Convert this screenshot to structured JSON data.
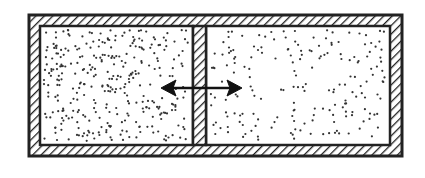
{
  "diagram": {
    "container": {
      "outer": [
        28,
        14,
        403,
        157
      ],
      "inner": [
        40,
        26,
        390,
        145
      ],
      "wall_pattern": "diagonal-hatch"
    },
    "partition": {
      "x": [
        193,
        206
      ],
      "pattern": "diagonal-hatch"
    },
    "chambers": [
      {
        "name": "left",
        "particle_density": "high"
      },
      {
        "name": "right",
        "particle_density": "low"
      }
    ],
    "arrow": {
      "type": "double-headed",
      "from": [
        163,
        88
      ],
      "to": [
        240,
        88
      ]
    },
    "colors": {
      "line": "#222222",
      "background": "#ffffff"
    }
  }
}
